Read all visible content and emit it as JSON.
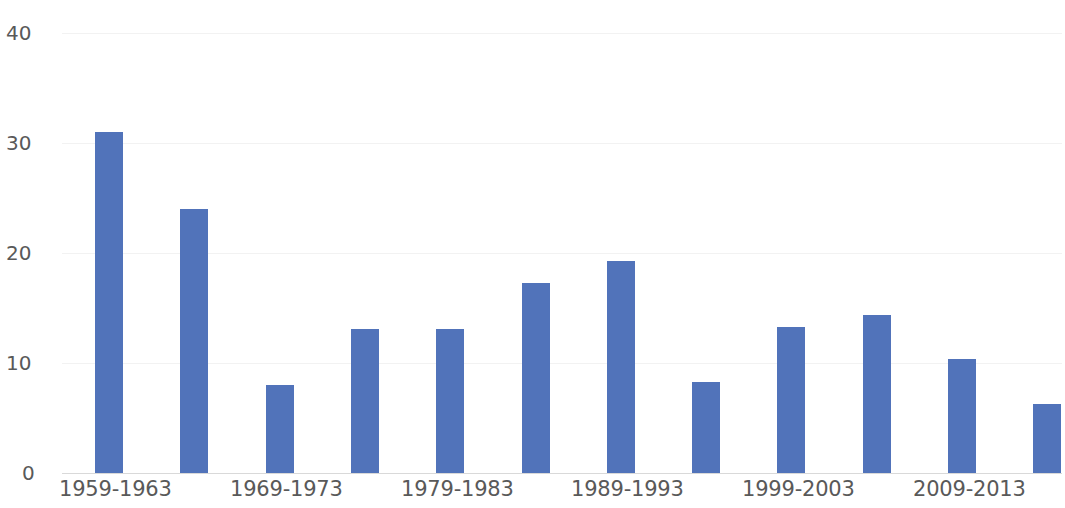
{
  "chart_data": {
    "type": "bar",
    "title": "",
    "subtitle": "",
    "xlabel": "",
    "ylabel": "",
    "ylim": [
      0,
      40
    ],
    "yticks": [
      0,
      10,
      20,
      30,
      40
    ],
    "ytick_labels": [
      "0",
      "10",
      "20",
      "30",
      "40"
    ],
    "grid": "horizontal-faint",
    "legend": "none",
    "bar_color": "#5173ba",
    "tick_label_color": "#595959",
    "background": "#ffffff",
    "categories": [
      "1959-1963",
      "1964-1968",
      "1969-1973",
      "1974-1978",
      "1979-1983",
      "1984-1988",
      "1989-1993",
      "1994-1998",
      "1999-2003",
      "2004-2008",
      "2009-2013",
      "2014-2018"
    ],
    "visible_xtick_labels": [
      "1959-1963",
      "1969-1973",
      "1979-1983",
      "1989-1993",
      "1999-2003",
      "2009-2013"
    ],
    "values": [
      31.0,
      24.0,
      8.0,
      13.1,
      13.1,
      17.3,
      19.3,
      8.3,
      13.3,
      14.4,
      10.4,
      6.3
    ]
  }
}
